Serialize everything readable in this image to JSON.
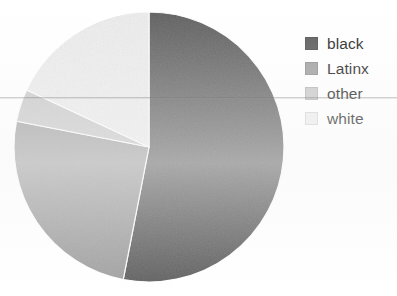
{
  "chart_data": {
    "type": "pie",
    "title": "",
    "subtitle": "",
    "xlabel": "",
    "ylabel": "",
    "grid": false,
    "legend_position": "right",
    "start_angle_deg": 0,
    "direction": "clockwise",
    "categories": [
      "black",
      "Latinx",
      "other",
      "white"
    ],
    "values": [
      53,
      25,
      4,
      18
    ],
    "unit": "percent",
    "slices": [
      {
        "label": "black",
        "value": 53,
        "color": "#595959",
        "start_deg": 0,
        "end_deg": 191
      },
      {
        "label": "Latinx",
        "value": 25,
        "color": "#9e9e9e",
        "start_deg": 191,
        "end_deg": 281
      },
      {
        "label": "other",
        "value": 4,
        "color": "#c8c8c8",
        "start_deg": 281,
        "end_deg": 295
      },
      {
        "label": "white",
        "value": 18,
        "color": "#ededed",
        "start_deg": 295,
        "end_deg": 360
      }
    ],
    "annotations": []
  },
  "pie": {
    "center_x": 149,
    "center_y": 147,
    "radius": 135,
    "wedge_border_color": "#ffffff",
    "wedge_border_width": 1.2
  },
  "legend": {
    "items": [
      {
        "label": "black",
        "swatch_color": "#595959"
      },
      {
        "label": "Latinx",
        "swatch_color": "#9e9e9e"
      },
      {
        "label": "other",
        "swatch_color": "#c8c8c8"
      },
      {
        "label": "white",
        "swatch_color": "#ededed"
      }
    ]
  },
  "artifacts": {
    "scan_line_y": 97,
    "background_color": "#ffffff"
  }
}
